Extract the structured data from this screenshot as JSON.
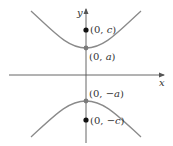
{
  "diagram": {
    "type": "hyperbola-vertical-transverse-axis",
    "axes": {
      "x_label": "x",
      "y_label": "y"
    },
    "points": [
      {
        "name": "focus-upper",
        "label_prefix": "(0, ",
        "label_var": "c",
        "label_suffix": ")",
        "style": "filled-black"
      },
      {
        "name": "vertex-upper",
        "label_prefix": "(0, ",
        "label_var": "a",
        "label_suffix": ")",
        "style": "filled-gray"
      },
      {
        "name": "vertex-lower",
        "label_prefix": "(0, ",
        "label_var": "−a",
        "label_suffix": ")",
        "style": "filled-gray"
      },
      {
        "name": "focus-lower",
        "label_prefix": "(0, ",
        "label_var": "−c",
        "label_suffix": ")",
        "style": "filled-black"
      }
    ],
    "colors": {
      "curve": "#8a8a8a",
      "axis": "#555555",
      "focus": "#111111",
      "vertex": "#7a7a7a",
      "text": "#333333"
    }
  }
}
